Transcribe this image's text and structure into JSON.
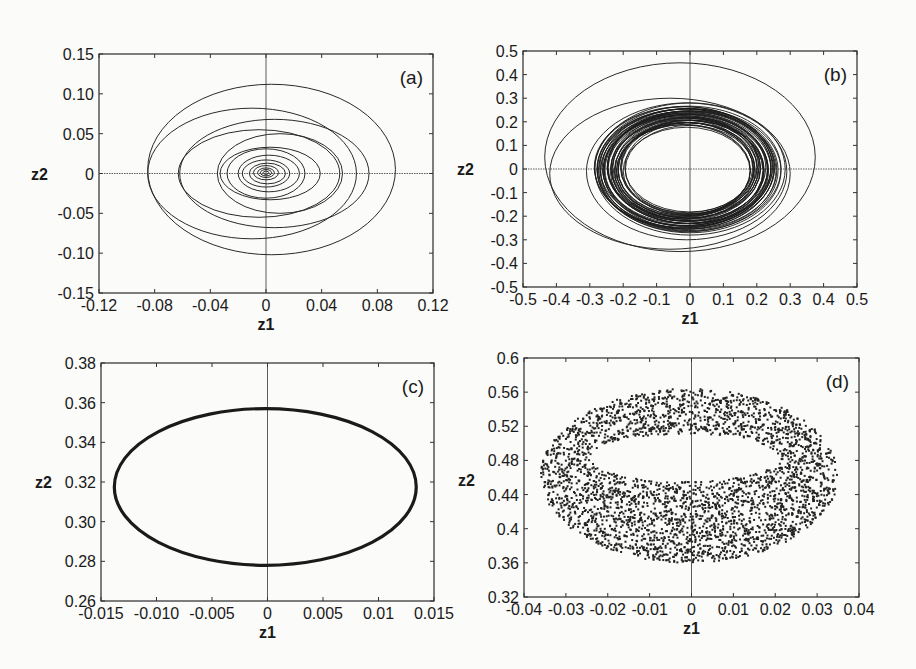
{
  "chart_data": [
    {
      "id": "a",
      "type": "line",
      "panel_label": "(a)",
      "title": "",
      "xlabel": "z1",
      "ylabel": "z2",
      "xlim": [
        -0.12,
        0.12
      ],
      "ylim": [
        -0.15,
        0.15
      ],
      "xticks": [
        -0.12,
        -0.08,
        -0.04,
        0,
        0.04,
        0.08,
        0.12
      ],
      "xtick_labels": [
        "-0.12",
        "-0.08",
        "-0.04",
        "0",
        "0.04",
        "0.08",
        "0.12"
      ],
      "yticks": [
        -0.15,
        -0.1,
        -0.05,
        0,
        0.05,
        0.1,
        0.15
      ],
      "ytick_labels": [
        "-0.15",
        "-0.10",
        "-0.05",
        "0",
        "0.05",
        "0.10",
        "0.15"
      ],
      "grid": false,
      "zero_lines": true,
      "description": "Trajectory spiralling inward to origin (stable focus)",
      "frame": [
        99,
        54,
        433,
        293
      ],
      "loops": [
        {
          "cx": 0.004,
          "cy": 0.005,
          "rx": 0.089,
          "ry": 0.107
        },
        {
          "cx": -0.01,
          "cy": 0.0,
          "rx": 0.075,
          "ry": 0.082
        },
        {
          "cx": 0.006,
          "cy": 0.0,
          "rx": 0.068,
          "ry": 0.068
        },
        {
          "cx": -0.005,
          "cy": 0.0,
          "rx": 0.058,
          "ry": 0.055
        },
        {
          "cx": 0.01,
          "cy": 0.0,
          "rx": 0.045,
          "ry": 0.05
        },
        {
          "cx": 0.003,
          "cy": 0.0,
          "rx": 0.036,
          "ry": 0.033
        },
        {
          "cx": 0.0,
          "cy": 0.0,
          "rx": 0.028,
          "ry": 0.031
        },
        {
          "cx": 0.002,
          "cy": 0.0,
          "rx": 0.022,
          "ry": 0.023
        },
        {
          "cx": 0.0,
          "cy": 0.0,
          "rx": 0.017,
          "ry": 0.017
        },
        {
          "cx": 0.001,
          "cy": 0.0,
          "rx": 0.013,
          "ry": 0.013
        },
        {
          "cx": 0.0,
          "cy": 0.001,
          "rx": 0.009,
          "ry": 0.009
        },
        {
          "cx": 0.0,
          "cy": 0.001,
          "rx": 0.006,
          "ry": 0.006
        },
        {
          "cx": 0.0,
          "cy": 0.001,
          "rx": 0.004,
          "ry": 0.004
        },
        {
          "cx": 0.0,
          "cy": 0.001,
          "rx": 0.002,
          "ry": 0.002
        }
      ]
    },
    {
      "id": "b",
      "type": "line",
      "panel_label": "(b)",
      "title": "",
      "xlabel": "z1",
      "ylabel": "z2",
      "xlim": [
        -0.5,
        0.5
      ],
      "ylim": [
        -0.5,
        0.5
      ],
      "xticks": [
        -0.5,
        -0.4,
        -0.3,
        -0.2,
        -0.1,
        0,
        0.1,
        0.2,
        0.3,
        0.4,
        0.5
      ],
      "xtick_labels": [
        "-0.5",
        "-0.4",
        "-0.3",
        "-0.2",
        "-0.1",
        "0",
        "0.1",
        "0.2",
        "0.3",
        "0.4",
        "0.5"
      ],
      "yticks": [
        -0.5,
        -0.4,
        -0.3,
        -0.2,
        -0.1,
        0,
        0.1,
        0.2,
        0.3,
        0.4,
        0.5
      ],
      "ytick_labels": [
        "-0.5",
        "-0.4",
        "-0.3",
        "-0.2",
        "-0.1",
        "0",
        "0.1",
        "0.2",
        "0.3",
        "0.4",
        "0.5"
      ],
      "grid": false,
      "zero_lines": true,
      "description": "Trajectory converging onto a limit cycle (dense ring)",
      "frame": [
        523,
        51,
        857,
        287
      ],
      "loops": [
        {
          "cx": -0.03,
          "cy": 0.05,
          "rx": 0.405,
          "ry": 0.4
        },
        {
          "cx": -0.06,
          "cy": -0.02,
          "rx": 0.36,
          "ry": 0.32
        },
        {
          "cx": -0.01,
          "cy": -0.01,
          "rx": 0.3,
          "ry": 0.29
        },
        {
          "cx": 0.0,
          "cy": 0.0,
          "rx": 0.285,
          "ry": 0.28
        }
      ],
      "ring": {
        "cx": -0.01,
        "cy": 0.0,
        "rx_outer": 0.275,
        "ry_outer": 0.265,
        "rx_inner": 0.19,
        "ry_inner": 0.185
      }
    },
    {
      "id": "c",
      "type": "scatter",
      "panel_label": "(c)",
      "title": "",
      "xlabel": "z1",
      "ylabel": "z2",
      "xlim": [
        -0.015,
        0.015
      ],
      "ylim": [
        0.26,
        0.38
      ],
      "xticks": [
        -0.015,
        -0.01,
        -0.005,
        0,
        0.005,
        0.01,
        0.015
      ],
      "xtick_labels": [
        "-0.015",
        "-0.010",
        "-0.005",
        "0",
        "0.005",
        "0.01",
        "0.015"
      ],
      "yticks": [
        0.26,
        0.28,
        0.3,
        0.32,
        0.34,
        0.36,
        0.38
      ],
      "ytick_labels": [
        "0.26",
        "0.28",
        "0.30",
        "0.32",
        "0.34",
        "0.36",
        "0.38"
      ],
      "grid": false,
      "zero_lines": "vertical",
      "description": "Poincare section: closed invariant curve (ellipse)",
      "frame": [
        101,
        363,
        434,
        601
      ],
      "ellipse": {
        "cx": -0.0002,
        "cy": 0.3175,
        "rx": 0.0136,
        "ry": 0.0395
      }
    },
    {
      "id": "d",
      "type": "scatter",
      "panel_label": "(d)",
      "title": "",
      "xlabel": "z1",
      "ylabel": "z2",
      "xlim": [
        -0.04,
        0.04
      ],
      "ylim": [
        0.32,
        0.6
      ],
      "xticks": [
        -0.04,
        -0.03,
        -0.02,
        -0.01,
        0,
        0.01,
        0.02,
        0.03,
        0.04
      ],
      "xtick_labels": [
        "-0.04",
        "-0.03",
        "-0.02",
        "-0.01",
        "0",
        "0.01",
        "0.02",
        "0.03",
        "0.04"
      ],
      "yticks": [
        0.32,
        0.36,
        0.4,
        0.44,
        0.48,
        0.52,
        0.56,
        0.6
      ],
      "ytick_labels": [
        "0.32",
        "0.36",
        "0.4",
        "0.44",
        "0.48",
        "0.52",
        "0.56",
        "0.6"
      ],
      "grid": false,
      "zero_lines": "vertical",
      "description": "Poincare section: scattered points forming torus-like band",
      "frame": [
        524,
        358,
        859,
        597
      ],
      "outer": {
        "cx": -0.0005,
        "cy": 0.462,
        "rx": 0.0355,
        "ry": 0.102
      },
      "inner": {
        "cx": -0.0015,
        "cy": 0.483,
        "rx": 0.0225,
        "ry": 0.028
      },
      "n_points": 3200
    }
  ]
}
